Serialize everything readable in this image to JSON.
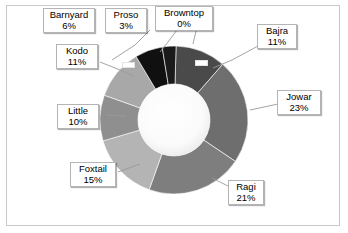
{
  "chart_data": {
    "type": "pie",
    "variant": "donut",
    "title": "",
    "xlabel": "",
    "ylabel": "",
    "legend": "none",
    "labels_format": "name + percent callouts with leader lines",
    "categories": [
      "Browntop",
      "Bajra",
      "Jowar",
      "Ragi",
      "Foxtail",
      "Little",
      "Kodo",
      "Barnyard",
      "Proso"
    ],
    "values": [
      0,
      11,
      23,
      21,
      15,
      10,
      11,
      6,
      3
    ],
    "units": "%",
    "slices": [
      {
        "name": "Browntop",
        "percent": "0%",
        "value": 0,
        "color": "#3d3d3d"
      },
      {
        "name": "Bajra",
        "percent": "11%",
        "value": 11,
        "color": "#4a4a4a"
      },
      {
        "name": "Jowar",
        "percent": "23%",
        "value": 23,
        "color": "#6e6e6e"
      },
      {
        "name": "Ragi",
        "percent": "21%",
        "value": 21,
        "color": "#7e7e7e"
      },
      {
        "name": "Foxtail",
        "percent": "15%",
        "value": 15,
        "color": "#b4b4b4"
      },
      {
        "name": "Little",
        "percent": "10%",
        "value": 10,
        "color": "#8f8f8f"
      },
      {
        "name": "Kodo",
        "percent": "11%",
        "value": 11,
        "color": "#a8a8a8"
      },
      {
        "name": "Barnyard",
        "percent": "6%",
        "value": 6,
        "color": "#101010"
      },
      {
        "name": "Proso",
        "percent": "3%",
        "value": 3,
        "color": "#1a1a1a"
      }
    ]
  },
  "callouts": {
    "barnyard": {
      "name": "Barnyard",
      "percent": "6%"
    },
    "proso": {
      "name": "Proso",
      "percent": "3%"
    },
    "browntop": {
      "name": "Browntop",
      "percent": "0%"
    },
    "bajra": {
      "name": "Bajra",
      "percent": "11%"
    },
    "jowar": {
      "name": "Jowar",
      "percent": "23%"
    },
    "ragi": {
      "name": "Ragi",
      "percent": "21%"
    },
    "foxtail": {
      "name": "Foxtail",
      "percent": "15%"
    },
    "little": {
      "name": "Little",
      "percent": "10%"
    },
    "kodo": {
      "name": "Kodo",
      "percent": "11%"
    }
  },
  "style": {
    "plot_border_color": "#c9c9c9",
    "background": "#ffffff",
    "leader_line_color": "#9a9a9a",
    "donut_hole_color": "#ffffff"
  }
}
